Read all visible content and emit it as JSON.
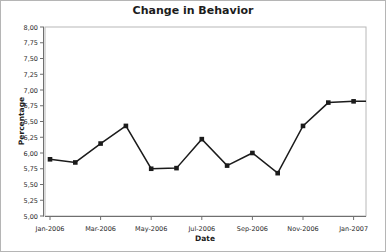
{
  "chart_data": {
    "type": "line",
    "title": "Change in Behavior",
    "xlabel": "Date",
    "ylabel": "Percentage",
    "categories": [
      "Jan-2006",
      "Feb-2006",
      "Mar-2006",
      "Apr-2006",
      "May-2006",
      "Jun-2006",
      "Jul-2006",
      "Aug-2006",
      "Sep-2006",
      "Oct-2006",
      "Nov-2006",
      "Dec-2006",
      "Jan-2007"
    ],
    "values": [
      5.9,
      5.85,
      6.15,
      6.43,
      5.75,
      5.76,
      6.22,
      5.8,
      6.0,
      5.68,
      6.43,
      6.8,
      6.82
    ],
    "ylim": [
      5.0,
      8.0
    ],
    "ytick_step": 0.25,
    "ytick_labels": [
      "8,00",
      "7,75",
      "7,50",
      "7,25",
      "7,00",
      "6,75",
      "6,50",
      "6,25",
      "6,00",
      "5,75",
      "5,50",
      "5,25",
      "5,00"
    ],
    "xtick_labels": [
      "Jan-2006",
      "Mar-2006",
      "May-2006",
      "Jul-2006",
      "Sep-2006",
      "Nov-2006",
      "Jan-2007"
    ],
    "grid": false,
    "legend": false,
    "line_color": "#1b1b1b",
    "marker": "square",
    "text_color": "#2a2a2a",
    "axis_color": "#6f6f6f",
    "plot_border_color": "#b8b8b8",
    "line_extends_flat_to_right_border": true
  }
}
